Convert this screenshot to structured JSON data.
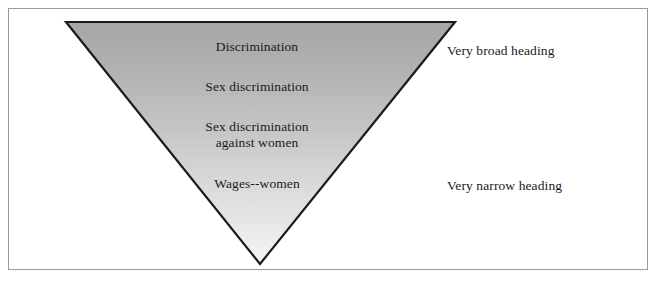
{
  "diagram": {
    "shape": "inverted-triangle",
    "colors": {
      "frame_border": "#9a9a9a",
      "triangle_outline": "#1c1c1c",
      "triangle_fill_top": "#a9a9a9",
      "triangle_fill_bottom": "#f0f0f0",
      "text": "#1a1a1a",
      "background": "#ffffff"
    },
    "geometry": {
      "top_left": [
        66,
        22
      ],
      "top_right": [
        455,
        22
      ],
      "apex": [
        260,
        264
      ]
    },
    "levels": [
      {
        "label": "Discrimination",
        "line2": ""
      },
      {
        "label": "Sex discrimination",
        "line2": ""
      },
      {
        "label": "Sex discrimination",
        "line2": "against women"
      },
      {
        "label": "Wages--women",
        "line2": ""
      }
    ],
    "side_labels": {
      "top": "Very broad heading",
      "bottom": "Very narrow heading"
    }
  }
}
